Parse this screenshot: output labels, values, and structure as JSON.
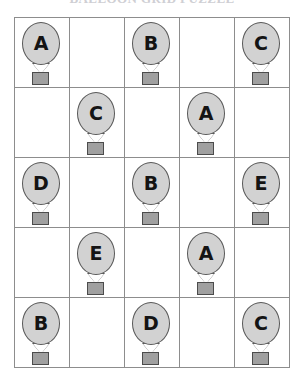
{
  "title": {
    "text": "BALLOON GRID PUZZLE",
    "clipped": true
  },
  "grid": {
    "rows": 5,
    "columns": 5,
    "border_color": "#5b5b5b",
    "line_color": "#8d8d8d",
    "background": "#ffffff"
  },
  "balloon": {
    "envelope_fill": "#d2d2d2",
    "envelope_stroke": "#595959",
    "basket_fill": "#a0a0a0",
    "basket_stroke": "#4c4c4c",
    "letter_color": "#141414"
  },
  "cells": [
    [
      {
        "label": "A",
        "filled": true
      },
      {
        "label": "",
        "filled": false
      },
      {
        "label": "B",
        "filled": true
      },
      {
        "label": "",
        "filled": false
      },
      {
        "label": "C",
        "filled": true
      }
    ],
    [
      {
        "label": "",
        "filled": false
      },
      {
        "label": "C",
        "filled": true
      },
      {
        "label": "",
        "filled": false
      },
      {
        "label": "A",
        "filled": true
      },
      {
        "label": "",
        "filled": false
      }
    ],
    [
      {
        "label": "D",
        "filled": true
      },
      {
        "label": "",
        "filled": false
      },
      {
        "label": "B",
        "filled": true
      },
      {
        "label": "",
        "filled": false
      },
      {
        "label": "E",
        "filled": true
      }
    ],
    [
      {
        "label": "",
        "filled": false
      },
      {
        "label": "E",
        "filled": true
      },
      {
        "label": "",
        "filled": false
      },
      {
        "label": "A",
        "filled": true
      },
      {
        "label": "",
        "filled": false
      }
    ],
    [
      {
        "label": "B",
        "filled": true
      },
      {
        "label": "",
        "filled": false
      },
      {
        "label": "D",
        "filled": true
      },
      {
        "label": "",
        "filled": false
      },
      {
        "label": "C",
        "filled": true
      }
    ]
  ]
}
